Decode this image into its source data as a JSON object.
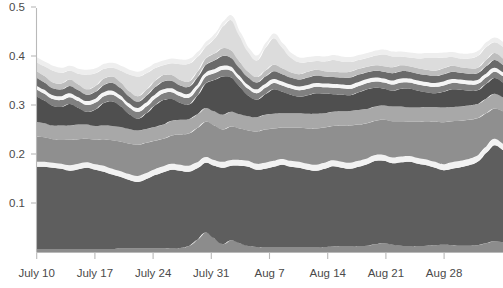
{
  "chart_data": {
    "type": "area",
    "stacked": true,
    "title": "",
    "subtitle": "",
    "xlabel": "",
    "ylabel": "",
    "grid": false,
    "legend_position": "none",
    "ylim": [
      0,
      0.55
    ],
    "yticks": [
      0.1,
      0.2,
      0.3,
      0.4,
      0.5
    ],
    "ytick_labels": [
      "0.1",
      "0.2",
      "0.3",
      "0.4",
      "0.5"
    ],
    "xtick_labels": [
      "July 10",
      "July 17",
      "July 24",
      "July 31",
      "Aug 7",
      "Aug 14",
      "Aug 21",
      "Aug 28"
    ],
    "xtick_positions_px": [
      36.7,
      94.9,
      153.1,
      211.3,
      269.5,
      327.7,
      385.9,
      444.1
    ],
    "x_index": [
      0,
      1,
      2,
      3,
      4,
      5,
      6,
      7,
      8,
      9,
      10,
      11,
      12,
      13,
      14,
      15,
      16,
      17,
      18,
      19,
      20,
      21,
      22,
      23,
      24,
      25,
      26,
      27,
      28,
      29,
      30,
      31,
      32,
      33,
      34,
      35,
      36,
      37,
      38,
      39,
      40,
      41,
      42,
      43,
      44,
      45,
      46,
      47,
      48,
      49,
      50,
      51,
      52,
      53,
      54,
      55
    ],
    "axis_colors": {
      "line": "#b9b9b9",
      "tick_text": "#4a4a4a",
      "background": "#ffffff"
    },
    "series": [
      {
        "name": "band-1-bottom-thin",
        "color": "#8c8c8c",
        "values": [
          0.006,
          0.006,
          0.006,
          0.006,
          0.006,
          0.006,
          0.006,
          0.006,
          0.006,
          0.006,
          0.007,
          0.007,
          0.007,
          0.007,
          0.007,
          0.007,
          0.008,
          0.008,
          0.012,
          0.025,
          0.04,
          0.028,
          0.016,
          0.024,
          0.018,
          0.012,
          0.01,
          0.01,
          0.01,
          0.01,
          0.01,
          0.01,
          0.01,
          0.01,
          0.01,
          0.011,
          0.012,
          0.012,
          0.012,
          0.013,
          0.016,
          0.018,
          0.015,
          0.013,
          0.012,
          0.012,
          0.013,
          0.014,
          0.015,
          0.014,
          0.013,
          0.013,
          0.014,
          0.018,
          0.022,
          0.02
        ]
      },
      {
        "name": "band-2-large-dark",
        "color": "#5e5e5e",
        "values": [
          0.168,
          0.168,
          0.166,
          0.164,
          0.16,
          0.163,
          0.166,
          0.162,
          0.158,
          0.152,
          0.146,
          0.14,
          0.136,
          0.142,
          0.15,
          0.156,
          0.16,
          0.158,
          0.152,
          0.146,
          0.142,
          0.148,
          0.156,
          0.152,
          0.158,
          0.162,
          0.158,
          0.16,
          0.164,
          0.168,
          0.164,
          0.162,
          0.158,
          0.156,
          0.16,
          0.164,
          0.16,
          0.158,
          0.162,
          0.166,
          0.17,
          0.168,
          0.166,
          0.17,
          0.172,
          0.168,
          0.164,
          0.158,
          0.152,
          0.156,
          0.16,
          0.164,
          0.17,
          0.184,
          0.196,
          0.188
        ]
      },
      {
        "name": "band-3-white-separator",
        "color": "#f2f2f2",
        "values": [
          0.01,
          0.01,
          0.01,
          0.01,
          0.011,
          0.011,
          0.011,
          0.011,
          0.012,
          0.012,
          0.012,
          0.012,
          0.012,
          0.012,
          0.012,
          0.012,
          0.012,
          0.012,
          0.012,
          0.012,
          0.012,
          0.012,
          0.012,
          0.012,
          0.012,
          0.012,
          0.012,
          0.012,
          0.012,
          0.012,
          0.012,
          0.012,
          0.012,
          0.012,
          0.012,
          0.012,
          0.012,
          0.012,
          0.012,
          0.012,
          0.012,
          0.012,
          0.012,
          0.012,
          0.012,
          0.012,
          0.012,
          0.012,
          0.012,
          0.013,
          0.013,
          0.013,
          0.013,
          0.013,
          0.013,
          0.013
        ]
      },
      {
        "name": "band-4-mid-gray",
        "color": "#8f8f8f",
        "values": [
          0.052,
          0.05,
          0.048,
          0.05,
          0.052,
          0.05,
          0.048,
          0.05,
          0.054,
          0.058,
          0.06,
          0.062,
          0.064,
          0.062,
          0.058,
          0.056,
          0.058,
          0.062,
          0.066,
          0.07,
          0.072,
          0.07,
          0.066,
          0.068,
          0.064,
          0.062,
          0.066,
          0.068,
          0.066,
          0.064,
          0.068,
          0.07,
          0.072,
          0.074,
          0.072,
          0.07,
          0.074,
          0.076,
          0.074,
          0.072,
          0.07,
          0.072,
          0.074,
          0.072,
          0.07,
          0.074,
          0.078,
          0.082,
          0.086,
          0.084,
          0.082,
          0.08,
          0.076,
          0.068,
          0.062,
          0.066
        ]
      },
      {
        "name": "band-5-light-gray",
        "color": "#a8a8a8",
        "values": [
          0.03,
          0.029,
          0.028,
          0.028,
          0.029,
          0.03,
          0.029,
          0.028,
          0.028,
          0.029,
          0.03,
          0.03,
          0.029,
          0.028,
          0.028,
          0.029,
          0.03,
          0.03,
          0.029,
          0.028,
          0.028,
          0.029,
          0.03,
          0.03,
          0.029,
          0.029,
          0.029,
          0.03,
          0.03,
          0.029,
          0.029,
          0.029,
          0.03,
          0.03,
          0.029,
          0.029,
          0.029,
          0.03,
          0.03,
          0.029,
          0.029,
          0.029,
          0.03,
          0.03,
          0.029,
          0.029,
          0.029,
          0.03,
          0.03,
          0.029,
          0.029,
          0.029,
          0.029,
          0.03,
          0.03,
          0.029
        ]
      },
      {
        "name": "band-6-dark-volatile",
        "color": "#4f4f4f",
        "values": [
          0.052,
          0.046,
          0.04,
          0.038,
          0.044,
          0.034,
          0.026,
          0.034,
          0.046,
          0.05,
          0.042,
          0.03,
          0.024,
          0.032,
          0.044,
          0.05,
          0.044,
          0.034,
          0.03,
          0.038,
          0.05,
          0.064,
          0.078,
          0.07,
          0.056,
          0.042,
          0.036,
          0.042,
          0.05,
          0.044,
          0.038,
          0.034,
          0.038,
          0.042,
          0.04,
          0.036,
          0.034,
          0.032,
          0.036,
          0.04,
          0.038,
          0.034,
          0.032,
          0.036,
          0.038,
          0.034,
          0.03,
          0.028,
          0.032,
          0.036,
          0.034,
          0.03,
          0.028,
          0.03,
          0.032,
          0.03
        ]
      },
      {
        "name": "band-7-medium",
        "color": "#808080",
        "values": [
          0.014,
          0.014,
          0.014,
          0.014,
          0.014,
          0.014,
          0.014,
          0.014,
          0.014,
          0.014,
          0.014,
          0.014,
          0.014,
          0.014,
          0.014,
          0.014,
          0.014,
          0.014,
          0.014,
          0.014,
          0.014,
          0.014,
          0.014,
          0.014,
          0.014,
          0.014,
          0.013,
          0.013,
          0.013,
          0.013,
          0.013,
          0.013,
          0.013,
          0.013,
          0.013,
          0.013,
          0.013,
          0.013,
          0.013,
          0.013,
          0.013,
          0.013,
          0.013,
          0.013,
          0.013,
          0.013,
          0.013,
          0.013,
          0.013,
          0.013,
          0.013,
          0.013,
          0.013,
          0.013,
          0.013,
          0.013
        ]
      },
      {
        "name": "band-8-white-separator",
        "color": "#f5f5f5",
        "values": [
          0.008,
          0.008,
          0.008,
          0.008,
          0.008,
          0.008,
          0.008,
          0.008,
          0.008,
          0.008,
          0.008,
          0.008,
          0.008,
          0.008,
          0.008,
          0.008,
          0.008,
          0.008,
          0.008,
          0.008,
          0.008,
          0.008,
          0.008,
          0.008,
          0.008,
          0.008,
          0.008,
          0.008,
          0.008,
          0.008,
          0.008,
          0.008,
          0.008,
          0.008,
          0.008,
          0.008,
          0.008,
          0.008,
          0.008,
          0.008,
          0.008,
          0.008,
          0.008,
          0.008,
          0.008,
          0.008,
          0.008,
          0.008,
          0.008,
          0.008,
          0.008,
          0.008,
          0.008,
          0.008,
          0.008,
          0.008
        ]
      },
      {
        "name": "band-9-dark-gray",
        "color": "#6a6a6a",
        "values": [
          0.016,
          0.015,
          0.014,
          0.014,
          0.015,
          0.014,
          0.013,
          0.014,
          0.015,
          0.016,
          0.015,
          0.014,
          0.013,
          0.014,
          0.015,
          0.016,
          0.015,
          0.014,
          0.014,
          0.015,
          0.016,
          0.018,
          0.02,
          0.018,
          0.016,
          0.015,
          0.014,
          0.015,
          0.016,
          0.015,
          0.014,
          0.014,
          0.015,
          0.015,
          0.014,
          0.014,
          0.014,
          0.015,
          0.015,
          0.014,
          0.014,
          0.014,
          0.015,
          0.015,
          0.014,
          0.014,
          0.014,
          0.014,
          0.015,
          0.015,
          0.014,
          0.014,
          0.014,
          0.015,
          0.016,
          0.015
        ]
      },
      {
        "name": "band-10-light",
        "color": "#bdbdbd",
        "values": [
          0.014,
          0.013,
          0.012,
          0.012,
          0.013,
          0.012,
          0.011,
          0.012,
          0.013,
          0.013,
          0.012,
          0.011,
          0.011,
          0.012,
          0.013,
          0.013,
          0.012,
          0.011,
          0.011,
          0.012,
          0.013,
          0.014,
          0.016,
          0.015,
          0.013,
          0.012,
          0.011,
          0.012,
          0.013,
          0.012,
          0.011,
          0.011,
          0.012,
          0.012,
          0.011,
          0.011,
          0.011,
          0.012,
          0.012,
          0.011,
          0.011,
          0.011,
          0.012,
          0.012,
          0.011,
          0.011,
          0.011,
          0.011,
          0.012,
          0.012,
          0.011,
          0.011,
          0.011,
          0.013,
          0.014,
          0.013
        ]
      },
      {
        "name": "band-11-pale-top",
        "color": "#dcdcdc",
        "values": [
          0.018,
          0.02,
          0.024,
          0.022,
          0.018,
          0.022,
          0.03,
          0.026,
          0.02,
          0.018,
          0.024,
          0.034,
          0.04,
          0.034,
          0.026,
          0.02,
          0.024,
          0.032,
          0.036,
          0.03,
          0.024,
          0.03,
          0.044,
          0.062,
          0.052,
          0.04,
          0.034,
          0.046,
          0.054,
          0.042,
          0.03,
          0.024,
          0.02,
          0.018,
          0.02,
          0.024,
          0.022,
          0.02,
          0.018,
          0.018,
          0.02,
          0.024,
          0.022,
          0.018,
          0.018,
          0.02,
          0.024,
          0.026,
          0.022,
          0.018,
          0.018,
          0.02,
          0.024,
          0.026,
          0.022,
          0.024
        ]
      },
      {
        "name": "band-12-very-pale-cap",
        "color": "#eeeeee",
        "values": [
          0.01,
          0.01,
          0.01,
          0.01,
          0.01,
          0.01,
          0.01,
          0.01,
          0.01,
          0.01,
          0.01,
          0.01,
          0.01,
          0.01,
          0.01,
          0.01,
          0.01,
          0.01,
          0.01,
          0.01,
          0.01,
          0.01,
          0.01,
          0.01,
          0.01,
          0.01,
          0.01,
          0.01,
          0.01,
          0.01,
          0.01,
          0.01,
          0.01,
          0.01,
          0.01,
          0.01,
          0.01,
          0.01,
          0.01,
          0.01,
          0.01,
          0.01,
          0.01,
          0.01,
          0.01,
          0.01,
          0.01,
          0.01,
          0.01,
          0.01,
          0.01,
          0.01,
          0.01,
          0.01,
          0.01,
          0.01
        ]
      }
    ]
  },
  "plot_geometry": {
    "left_px": 36,
    "right_px": 503,
    "top_px": 8,
    "bottom_px": 252,
    "y_value_at_bottom": 0,
    "y_value_at_top": 0.5498,
    "y_px_per_unit": 490
  }
}
